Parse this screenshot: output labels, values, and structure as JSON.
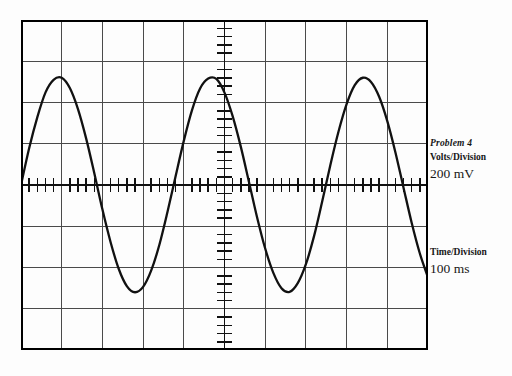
{
  "figure": {
    "kind": "oscilloscope-display",
    "caption": "Problem 4"
  },
  "annotations": {
    "volts_caption": "Volts/Division",
    "volts_value": "200 mV",
    "time_caption": "Time/Division",
    "time_value": "100 ms"
  },
  "colors": {
    "trace": "#111111",
    "grid": "#444444",
    "border": "#000000",
    "background": "#fdfdfd"
  },
  "chart_data": {
    "type": "line",
    "title": "Problem 4",
    "xlabel": "Time/Division 100 ms",
    "ylabel": "Volts/Division 200 mV",
    "grid": true,
    "legend": "none",
    "graticule": {
      "horizontal_divisions": 10,
      "vertical_divisions": 8,
      "division_px_x": 40.7,
      "division_px_y": 41.25,
      "center_axis_x_div": 5,
      "center_axis_y_div": 4,
      "subdivisions_per_division": 5,
      "tick_axes": [
        "horizontal-center",
        "vertical-center"
      ]
    },
    "scales": {
      "volts_per_division": "200 mV",
      "time_per_division": "100 ms"
    },
    "waveform": {
      "shape": "sine",
      "amplitude_divisions": 2.6,
      "amplitude_volts": 0.52,
      "peak_to_peak_divisions": 5.2,
      "peak_to_peak_volts": 1.04,
      "period_divisions": 3.55,
      "period_ms": 355,
      "frequency_hz": 2.82,
      "phase_at_left_edge": "rising through zero",
      "cycles_shown": 2.8
    },
    "xlim": [
      0,
      10
    ],
    "ylim": [
      -4,
      4
    ],
    "x": [
      0.0,
      0.2,
      0.4,
      0.6,
      0.8,
      1.0,
      1.2,
      1.4,
      1.6,
      1.8,
      2.0,
      2.2,
      2.4,
      2.6,
      2.8,
      3.0,
      3.2,
      3.4,
      3.6,
      3.8,
      4.0,
      4.2,
      4.4,
      4.6,
      4.8,
      5.0,
      5.2,
      5.4,
      5.6,
      5.8,
      6.0,
      6.2,
      6.4,
      6.6,
      6.8,
      7.0,
      7.2,
      7.4,
      7.6,
      7.8,
      8.0,
      8.2,
      8.4,
      8.6,
      8.8,
      9.0,
      9.2,
      9.4,
      9.6,
      9.8,
      10.0
    ],
    "y": [
      0.0,
      0.89,
      1.64,
      2.24,
      2.55,
      2.6,
      2.35,
      1.84,
      1.13,
      0.29,
      -0.59,
      -1.38,
      -2.03,
      -2.45,
      -2.6,
      -2.47,
      -2.07,
      -1.45,
      -0.65,
      0.22,
      1.07,
      1.81,
      2.34,
      2.58,
      2.57,
      2.24,
      1.67,
      0.93,
      0.08,
      -0.78,
      -1.54,
      -2.13,
      -2.5,
      -2.59,
      -2.38,
      -1.92,
      -1.24,
      -0.4,
      0.48,
      1.29,
      1.96,
      2.42,
      2.6,
      2.5,
      2.14,
      1.55,
      0.79,
      -0.07,
      -0.92,
      -1.66,
      -2.24
    ],
    "annotations": [
      {
        "text": "Problem 4",
        "position": "right-panel"
      },
      {
        "text": "Volts/Division",
        "position": "right-panel"
      },
      {
        "text": "200 mV",
        "position": "right-panel"
      },
      {
        "text": "Time/Division",
        "position": "right-panel"
      },
      {
        "text": "100 ms",
        "position": "right-panel"
      }
    ]
  }
}
